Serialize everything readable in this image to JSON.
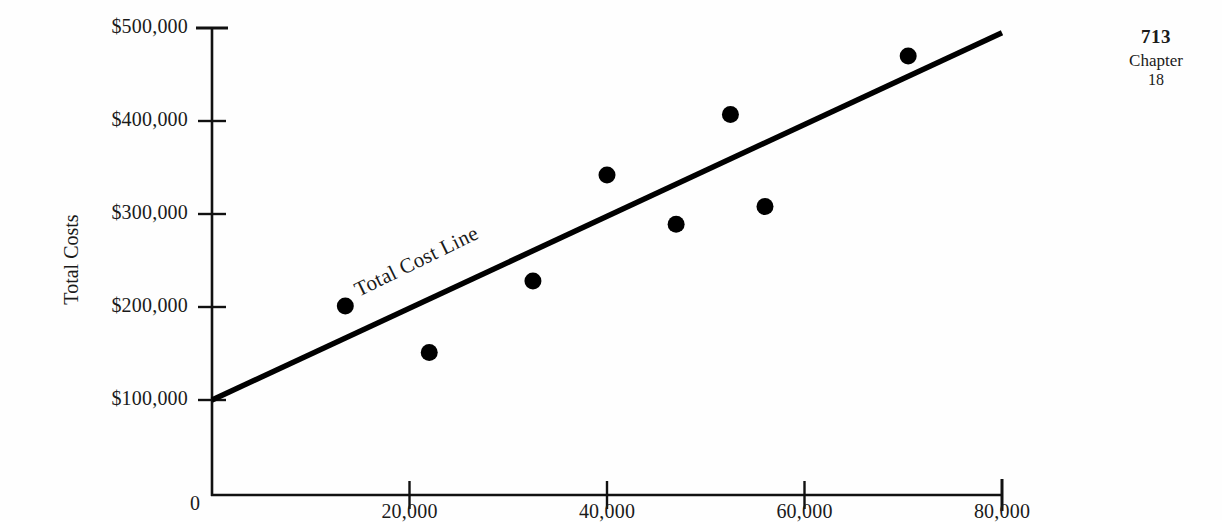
{
  "page_header": {
    "page_number": "713",
    "chapter_word": "Chapter",
    "chapter_number": "18"
  },
  "chart_data": {
    "type": "scatter",
    "title": "",
    "subtitle": "",
    "xlabel": "",
    "ylabel": "Total Costs",
    "xlim": [
      0,
      80000
    ],
    "ylim": [
      0,
      500000
    ],
    "grid": false,
    "legend_position": "none",
    "x_ticks": [
      {
        "value": 0,
        "label": "0"
      },
      {
        "value": 20000,
        "label": "20,000"
      },
      {
        "value": 40000,
        "label": "40,000"
      },
      {
        "value": 60000,
        "label": "60,000"
      },
      {
        "value": 80000,
        "label": "80,000"
      }
    ],
    "y_ticks": [
      {
        "value": 100000,
        "label": "$100,000"
      },
      {
        "value": 200000,
        "label": "$200,000"
      },
      {
        "value": 300000,
        "label": "$300,000"
      },
      {
        "value": 400000,
        "label": "$400,000"
      },
      {
        "value": 500000,
        "label": "$500,000"
      }
    ],
    "series": [
      {
        "name": "Observed Costs",
        "type": "scatter",
        "marker": "filled-circle",
        "color": "#000000",
        "points": [
          {
            "x": 13500,
            "y": 201000
          },
          {
            "x": 22000,
            "y": 151000
          },
          {
            "x": 32500,
            "y": 228000
          },
          {
            "x": 40000,
            "y": 342000
          },
          {
            "x": 47000,
            "y": 289000
          },
          {
            "x": 52500,
            "y": 407000
          },
          {
            "x": 56000,
            "y": 308000
          },
          {
            "x": 70500,
            "y": 470000
          }
        ]
      },
      {
        "name": "Total Cost Line",
        "type": "line",
        "color": "#000000",
        "annotation": "Total Cost Line",
        "endpoints": [
          {
            "x": 0,
            "y": 100000
          },
          {
            "x": 80000,
            "y": 495000
          }
        ]
      }
    ],
    "annotations": [
      {
        "text": "Total Cost Line",
        "x": 22000,
        "y": 247000,
        "rotation": -26
      }
    ]
  }
}
